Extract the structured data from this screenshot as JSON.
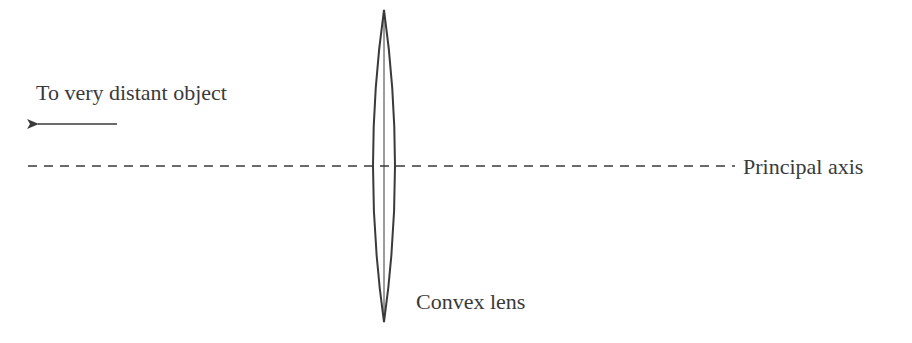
{
  "diagram": {
    "type": "optics-ray-diagram",
    "labels": {
      "object": "To very distant object",
      "axis": "Principal axis",
      "lens": "Convex lens"
    },
    "elements": {
      "arrow": {
        "direction": "left",
        "x1": 117,
        "x2": 36,
        "y": 124
      },
      "principal_axis": {
        "style": "dashed",
        "x1": 28,
        "x2": 735,
        "y": 166
      },
      "lens": {
        "kind": "convex",
        "center_x": 384,
        "top_y": 10,
        "bottom_y": 322,
        "half_width": 14
      }
    },
    "colors": {
      "stroke": "#3a3a3a",
      "text": "#3a3a3a",
      "background": "#ffffff"
    }
  }
}
